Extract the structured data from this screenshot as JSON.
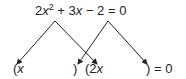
{
  "equation": {
    "coef_a": "2",
    "var1": "x",
    "exp": "2",
    "op1": " + 3",
    "var2": "x",
    "rest": " − 2 = 0"
  },
  "factors": {
    "open1": "(",
    "var1": "x",
    "close1": ")",
    "open2": "(2",
    "var2": "x",
    "close2": ") = 0"
  },
  "colors": {
    "ink": "#222222",
    "background": "#ffffff"
  }
}
